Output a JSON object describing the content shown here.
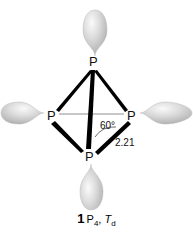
{
  "figure": {
    "name": "p4-tetrahedron-structure",
    "molecule": "P4",
    "atoms": [
      {
        "id": "p-top",
        "label": "P",
        "x": 93,
        "y": 62
      },
      {
        "id": "p-left",
        "label": "P",
        "x": 51,
        "y": 116
      },
      {
        "id": "p-right",
        "label": "P",
        "x": 131,
        "y": 116
      },
      {
        "id": "p-bottom",
        "label": "P",
        "x": 89,
        "y": 157
      }
    ],
    "measurements": {
      "bond_angle": "60°",
      "bond_angle_x": 108,
      "bond_angle_y": 126,
      "bond_length": "2.21",
      "bond_length_x": 122,
      "bond_length_y": 143
    },
    "lone_pairs": [
      {
        "id": "lobe-top",
        "direction": "up"
      },
      {
        "id": "lobe-left",
        "direction": "left"
      },
      {
        "id": "lobe-right",
        "direction": "right"
      },
      {
        "id": "lobe-bottom",
        "direction": "down"
      }
    ],
    "colors": {
      "bond_bold": "#000000",
      "bond_thin": "#8c8c8c",
      "arc": "#4d4d4d",
      "lobe_light": "#f2f2f2",
      "lobe_mid": "#c9c9c9",
      "lobe_dark": "#9a9a9a",
      "text": "#111111",
      "background": "#ffffff"
    }
  },
  "caption": {
    "number": "1",
    "formula": "P",
    "formula_sub": "4",
    "separator": ", ",
    "symmetry": "T",
    "symmetry_sub": "d"
  }
}
